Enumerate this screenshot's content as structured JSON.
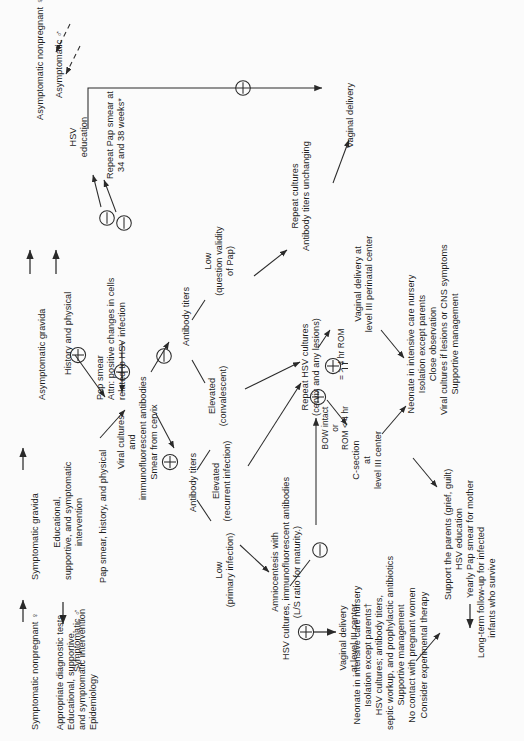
{
  "figure": {
    "orientation": "text-rotated-90-ccw",
    "background": "#fbfbfb",
    "ink": "#1d1d1d"
  },
  "nodes": {
    "asymptomatic_nonpregnant_female": "Asymptomatic nonpregnant ♀",
    "asymptomatic_male": "Asymptomatic ♂",
    "hsv_education": "HSV\neducation",
    "asymptomatic_gravida": "Asymptomatic gravida",
    "history_and_physical": "History and physical",
    "pap_smear_attn": "Pap smear\nAttn: positive changes in cells\nrelated to HSV infection",
    "repeat_pap_smear": "Repeat Pap smear at\n34 and 38 weeks*",
    "symptomatic_nonpregnant_female": "Symptomatic nonpregnant ♀",
    "symptomatic_male": "Symptomatic ♂",
    "appropriate_diagnostic_tests": "Appropriate diagnostic tests\nEducational, supportive,\nand symptomatic intervention\nEpidemiology",
    "symptomatic_gravida": "Symptomatic gravida",
    "educational_supportive": "Educational,\nsupportive, and symptomatic\nintervention",
    "pap_smear_history_physical": "Pap smear, history, and physical",
    "viral_cultures": "Viral cultures\nand\nimmunofluorescent antibodies\nSmear from cervix",
    "antibody_titers_upper": "Antibody titers",
    "antibody_titers_lower": "Antibody titers",
    "low_question_validity": "Low\n(question validity\nof Pap)",
    "elevated_convalescent": "Elevated\n(convalescent)",
    "elevated_recurrent": "Elevated\n(recurrent infection)",
    "low_primary": "Low\n(primary infection)",
    "repeat_cultures": "Repeat cultures\nAntibody titers unchanging",
    "vaginal_delivery": "Vaginal delivery",
    "repeat_hsv_cultures": "Repeat HSV cultures\n(cervix and any lesions)",
    "bow_intact": "BOW intact\nor\nROM < 4 hr",
    "rom_gt_4hr": "= > 4 hr ROM",
    "c_section": "C-section\nat\nlevel III center",
    "vaginal_delivery_level3": "Vaginal delivery at\nlevel III perinatal center",
    "amniocentesis": "Amniocentesis with\nHSV cultures, immunofluorescent antibodies\n(L/S ratio for maturity.)",
    "vaginal_delivery_level3b": "Vaginal delivery\nat level III center",
    "neonate_icn_a": "Neonate in intensive care nursery\nIsolation except parents\nClose observation\nViral cultures if lesions or CNS symptoms\nSupportive management",
    "neonate_icn_b": "Neonate in intensive care nursery\nIsolation except parents†\nHSV cultures; antibody titers,\nseptic workup, and prophylactic antibiotics\nSupportive management\nNo contact with pregnant women\nConsider experimental therapy",
    "support_parents": "Support the parents (grief, guilt)\nHSV education\nYearly Pap smear for mother",
    "long_term_followup": "Long-term follow-up for infected\ninfants who survive"
  },
  "symbols": {
    "minus": "⊖",
    "plus": "⊕",
    "minus_label": "negative result",
    "plus_label": "positive result"
  }
}
